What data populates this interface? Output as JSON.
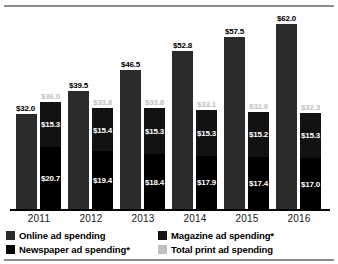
{
  "chart_data": {
    "type": "bar",
    "title": "",
    "subtitle": "",
    "xlabel": "",
    "ylabel": "",
    "ylim": [
      0,
      66
    ],
    "grid": false,
    "legend_position": "bottom",
    "categories": [
      "2011",
      "2012",
      "2013",
      "2014",
      "2015",
      "2016"
    ],
    "series": [
      {
        "name": "Online ad spending",
        "color": "#2b2b2b",
        "stack": "online",
        "values": [
          32.0,
          39.5,
          46.5,
          52.8,
          57.5,
          62.0
        ],
        "labels": [
          "$32.0",
          "$39.5",
          "$46.5",
          "$52.8",
          "$57.5",
          "$62.0"
        ]
      },
      {
        "name": "Magazine ad spending*",
        "color": "#121212",
        "stack": "print",
        "values": [
          15.3,
          15.4,
          15.3,
          15.3,
          15.2,
          15.3
        ],
        "labels": [
          "$15.3",
          "$15.4",
          "$15.3",
          "$15.3",
          "$15.2",
          "$15.3"
        ]
      },
      {
        "name": "Newspaper ad spending*",
        "color": "#000000",
        "stack": "print",
        "values": [
          20.7,
          19.4,
          18.4,
          17.9,
          17.4,
          17.0
        ],
        "labels": [
          "$20.7",
          "$19.4",
          "$18.4",
          "$17.9",
          "$17.4",
          "$17.0"
        ]
      },
      {
        "name": "Total print ad spending",
        "color": "#bfbfbf",
        "stack": "print-total",
        "values": [
          36.0,
          33.8,
          33.8,
          33.1,
          32.6,
          32.3
        ],
        "labels": [
          "$36.0",
          "$33.8",
          "$33.8",
          "$33.1",
          "$32.6",
          "$32.3"
        ]
      }
    ]
  },
  "legend": {
    "items": [
      {
        "label": "Online ad spending",
        "color": "#2b2b2b"
      },
      {
        "label": "Magazine ad spending*",
        "color": "#121212"
      },
      {
        "label": "Newspaper ad spending*",
        "color": "#000000"
      },
      {
        "label": "Total print ad spending",
        "color": "#bfbfbf"
      }
    ]
  }
}
